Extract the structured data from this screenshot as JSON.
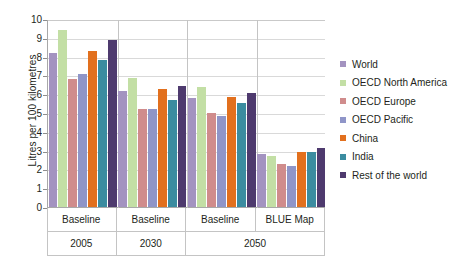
{
  "chart_data": {
    "type": "bar",
    "title": "",
    "xlabel": "",
    "ylabel": "Litres per 100 kilometres",
    "ylim": [
      0,
      10
    ],
    "yticks": [
      0,
      1,
      2,
      3,
      4,
      5,
      6,
      7,
      8,
      9,
      10
    ],
    "grid": true,
    "legend_position": "right",
    "categories": [
      "Baseline",
      "Baseline",
      "Baseline",
      "BLUE Map"
    ],
    "category_groups": [
      {
        "label": "2005",
        "span": 1
      },
      {
        "label": "2030",
        "span": 1
      },
      {
        "label": "2050",
        "span": 2
      }
    ],
    "series": [
      {
        "name": "World",
        "color": "#a393c0",
        "values": [
          8.2,
          6.15,
          5.8,
          2.8
        ]
      },
      {
        "name": "OECD North America",
        "color": "#c3dfa5",
        "values": [
          9.4,
          6.85,
          6.4,
          2.7
        ]
      },
      {
        "name": "OECD Europe",
        "color": "#d08c8c",
        "values": [
          6.8,
          5.2,
          5.0,
          2.3
        ]
      },
      {
        "name": "OECD Pacific",
        "color": "#8f95c8",
        "values": [
          7.1,
          5.2,
          4.85,
          2.2
        ]
      },
      {
        "name": "China",
        "color": "#e2701e",
        "values": [
          8.3,
          6.3,
          5.85,
          2.95
        ]
      },
      {
        "name": "India",
        "color": "#3b8ca0",
        "values": [
          7.8,
          5.7,
          5.55,
          2.95
        ]
      },
      {
        "name": "Rest of the world",
        "color": "#4e3a6e",
        "values": [
          8.9,
          6.45,
          6.05,
          3.15
        ]
      }
    ]
  },
  "legend": {
    "items": [
      {
        "label": "World"
      },
      {
        "label": "OECD North America"
      },
      {
        "label": "OECD Europe"
      },
      {
        "label": "OECD Pacific"
      },
      {
        "label": "China"
      },
      {
        "label": "India"
      },
      {
        "label": "Rest of the world"
      }
    ]
  }
}
